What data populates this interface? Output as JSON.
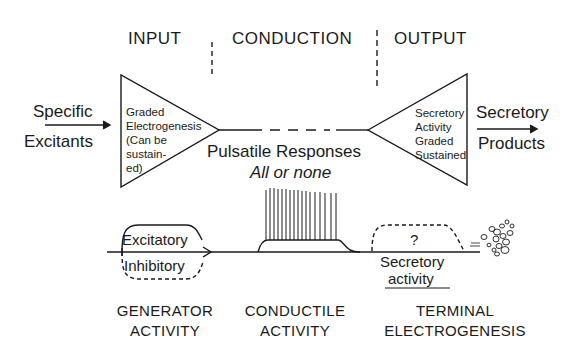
{
  "sections": {
    "input": "INPUT",
    "conduction": "CONDUCTION",
    "output": "OUTPUT"
  },
  "left": {
    "stimulus_line1": "Specific",
    "stimulus_line2": "Excitants",
    "triangle_text": [
      "Graded",
      "Electrogenesis",
      "(Can be",
      "sustain-",
      "ed)"
    ]
  },
  "right": {
    "triangle_text": [
      "Secretory",
      "Activity",
      "Graded",
      "Sustained"
    ],
    "product_line1": "Secretory",
    "product_line2": "Products"
  },
  "middle": {
    "label": "Pulsatile Responses",
    "sublabel": "All or none"
  },
  "traces": {
    "excitatory": "Excitatory",
    "inhibitory": "Inhibitory",
    "question": "?",
    "secretory_line1": "Secretory",
    "secretory_line2": "activity"
  },
  "captions": {
    "generator_line1": "GENERATOR",
    "generator_line2": "ACTIVITY",
    "conductile_line1": "CONDUCTILE",
    "conductile_line2": "ACTIVITY",
    "terminal_line1": "TERMINAL",
    "terminal_line2": "ELECTROGENESIS"
  },
  "colors": {
    "ink": "#1a1a1a",
    "background": "#ffffff"
  }
}
